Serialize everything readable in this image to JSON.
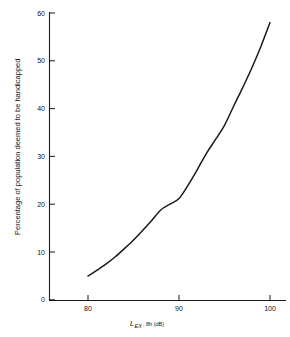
{
  "chart_data": {
    "type": "line",
    "title": "",
    "xlabel": "L_EX, 8h (dB)",
    "xlabel_parts": {
      "main": "L",
      "subscript": "EX",
      "rest": ", 8h (dB)"
    },
    "ylabel": "Percentage of population deemed to be handicapped",
    "xlim": [
      76,
      103
    ],
    "ylim": [
      0,
      62
    ],
    "xticks": [
      80,
      90,
      100
    ],
    "xtick_labels": [
      "80",
      "90",
      "100"
    ],
    "yticks": [
      0,
      10,
      20,
      30,
      40,
      50,
      60
    ],
    "ytick_labels": [
      "0",
      "10",
      "20",
      "30",
      "40",
      "50",
      "60"
    ],
    "grid": false,
    "legend": false,
    "series": [
      {
        "name": "Percentage handicapped",
        "color": "#1a1a1a",
        "x": [
          80,
          81,
          82,
          83,
          84,
          85,
          86,
          87,
          88,
          89,
          90,
          91,
          92,
          93,
          94,
          95,
          96,
          97,
          98,
          99,
          100
        ],
        "values": [
          5.0,
          6.2,
          7.5,
          9.0,
          10.7,
          12.5,
          14.5,
          16.6,
          18.8,
          20.0,
          21.2,
          24.0,
          27.2,
          30.6,
          33.5,
          36.5,
          40.5,
          44.4,
          48.5,
          53.0,
          58.0
        ]
      }
    ]
  },
  "figure": {
    "background_color": "#ffffff",
    "axis_color": "#1a1a1a",
    "curve_color": "#1a1a1a"
  }
}
